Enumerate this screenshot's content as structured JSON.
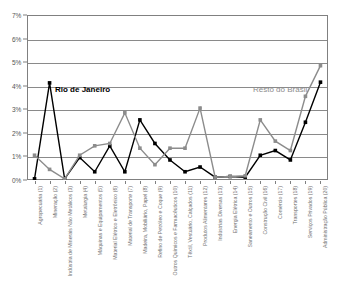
{
  "chart_data": {
    "type": "line",
    "title": "",
    "xlabel": "",
    "ylabel": "",
    "ylim": [
      0,
      7
    ],
    "ytick_labels": [
      "0%",
      "1%",
      "2%",
      "3%",
      "4%",
      "5%",
      "6%",
      "7%"
    ],
    "ytick_values": [
      0,
      1,
      2,
      3,
      4,
      5,
      6,
      7
    ],
    "grid": true,
    "legend_position": "inside",
    "categories": [
      "Agropecuária (1)",
      "Mineração (2)",
      "Indústria de Minerais Não Metálicos (3)",
      "Metalurgia (4)",
      "Máquinas e Equipamentos (5)",
      "Material Elétrico e Eletrônico (6)",
      "Material de Transporte (7)",
      "Madeira, Mobiliário, Papel (8)",
      "Refino de Petróleo e Coque (9)",
      "Outros Químicos e Farmacêuticos (10)",
      "Têxtil, Vestuário, Calçados (11)",
      "Produtos Alimentares (12)",
      "Indústrias Diversas (13)",
      "Energia Elétrica (14)",
      "Saneamento e Outros (15)",
      "Construção Civil (16)",
      "Comércio (17)",
      "Transportes (18)",
      "Serviços Privados (19)",
      "Administração Pública (20)"
    ],
    "series": [
      {
        "name": "Rio de Janeiro",
        "color": "#000000",
        "marker": "square",
        "values": [
          0.05,
          4.12,
          0.05,
          0.95,
          0.35,
          1.45,
          0.35,
          2.55,
          1.55,
          0.85,
          0.35,
          0.55,
          0.12,
          0.15,
          0.12,
          1.05,
          1.25,
          0.85,
          2.45,
          4.15
        ]
      },
      {
        "name": "Resto do Brasil",
        "color": "#8c8c8c",
        "marker": "square",
        "values": [
          1.05,
          0.45,
          0.05,
          1.05,
          1.45,
          1.55,
          2.85,
          1.35,
          0.65,
          1.35,
          1.35,
          3.05,
          0.12,
          0.15,
          0.18,
          2.55,
          1.65,
          1.25,
          3.55,
          4.85
        ]
      }
    ]
  },
  "legend_labels": {
    "rio": "Rio de Janeiro",
    "resto": "Resto do Brasil"
  },
  "title_strip": ""
}
